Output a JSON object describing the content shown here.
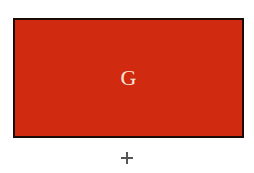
{
  "stimulus": {
    "card": {
      "letter": "G",
      "fill_color": "#d02a10",
      "border_color": "#1a0a06",
      "letter_color": "#f6e6d8"
    },
    "fixation": {
      "icon": "plus-icon",
      "color": "#555555"
    }
  }
}
